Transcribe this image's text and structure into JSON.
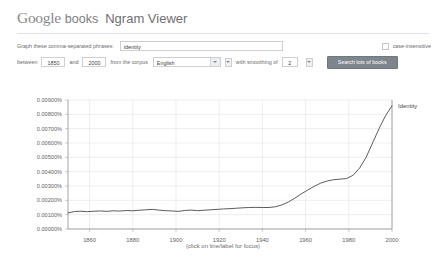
{
  "header": {
    "logo_google": "Google",
    "logo_books": "books",
    "title": "Ngram Viewer"
  },
  "form": {
    "phrases_label": "Graph these comma-separated phrases:",
    "phrases_value": "identity",
    "phrases_placeholder": "",
    "case_insensitive_label": "case-insensitive",
    "between_label": "between",
    "year_start": "1850",
    "and_label": "and",
    "year_end": "2000",
    "corpus_label": "from the corpus",
    "corpus_value": "English",
    "smoothing_label": "with smoothing of",
    "smoothing_value": "2",
    "search_button_label": "Search lots of books",
    "dropdown_icon": "chevron-down-icon",
    "checkbox_icon": "checkbox-unchecked-icon"
  },
  "footnote": "(click on line/label for focus)",
  "chart_data": {
    "type": "line",
    "title": "",
    "xlabel": "",
    "ylabel": "",
    "xlim": [
      1850,
      2000
    ],
    "ylim": [
      0.0,
      0.009
    ],
    "grid": true,
    "legend_position": "right-inline",
    "xticks": [
      1860,
      1880,
      1900,
      1920,
      1940,
      1960,
      1980,
      2000
    ],
    "yticks": [
      0.0,
      0.001,
      0.002,
      0.003,
      0.004,
      0.005,
      0.006,
      0.007,
      0.008,
      0.009
    ],
    "ytick_labels": [
      "0.00000%",
      "0.00100%",
      "0.00200%",
      "0.00300%",
      "0.00400%",
      "0.00500%",
      "0.00600%",
      "0.00700%",
      "0.00800%",
      "0.00900%"
    ],
    "xtick_labels": [
      "1860",
      "1880",
      "1900",
      "1920",
      "1940",
      "1960",
      "1980",
      "2000"
    ],
    "line_color": "#4a4a4a",
    "series": [
      {
        "name": "Identity",
        "x": [
          1850,
          1853,
          1856,
          1859,
          1862,
          1865,
          1868,
          1871,
          1874,
          1877,
          1880,
          1883,
          1886,
          1889,
          1892,
          1895,
          1898,
          1901,
          1904,
          1907,
          1910,
          1913,
          1916,
          1919,
          1922,
          1925,
          1928,
          1931,
          1934,
          1937,
          1940,
          1943,
          1946,
          1949,
          1952,
          1955,
          1958,
          1961,
          1964,
          1967,
          1970,
          1973,
          1976,
          1979,
          1982,
          1985,
          1988,
          1991,
          1994,
          1997,
          2000
        ],
        "values": [
          0.00112,
          0.00122,
          0.00124,
          0.00121,
          0.00124,
          0.00126,
          0.00123,
          0.00127,
          0.00125,
          0.00129,
          0.00127,
          0.00131,
          0.00134,
          0.00137,
          0.00132,
          0.00128,
          0.00126,
          0.00123,
          0.00129,
          0.00132,
          0.00128,
          0.00131,
          0.00134,
          0.00137,
          0.0014,
          0.00142,
          0.00145,
          0.00148,
          0.0015,
          0.00151,
          0.0015,
          0.0015,
          0.00155,
          0.00168,
          0.00188,
          0.00215,
          0.00245,
          0.00272,
          0.00298,
          0.0032,
          0.00335,
          0.00344,
          0.00348,
          0.00352,
          0.00375,
          0.00425,
          0.005,
          0.006,
          0.007,
          0.0079,
          0.0086
        ]
      }
    ]
  }
}
